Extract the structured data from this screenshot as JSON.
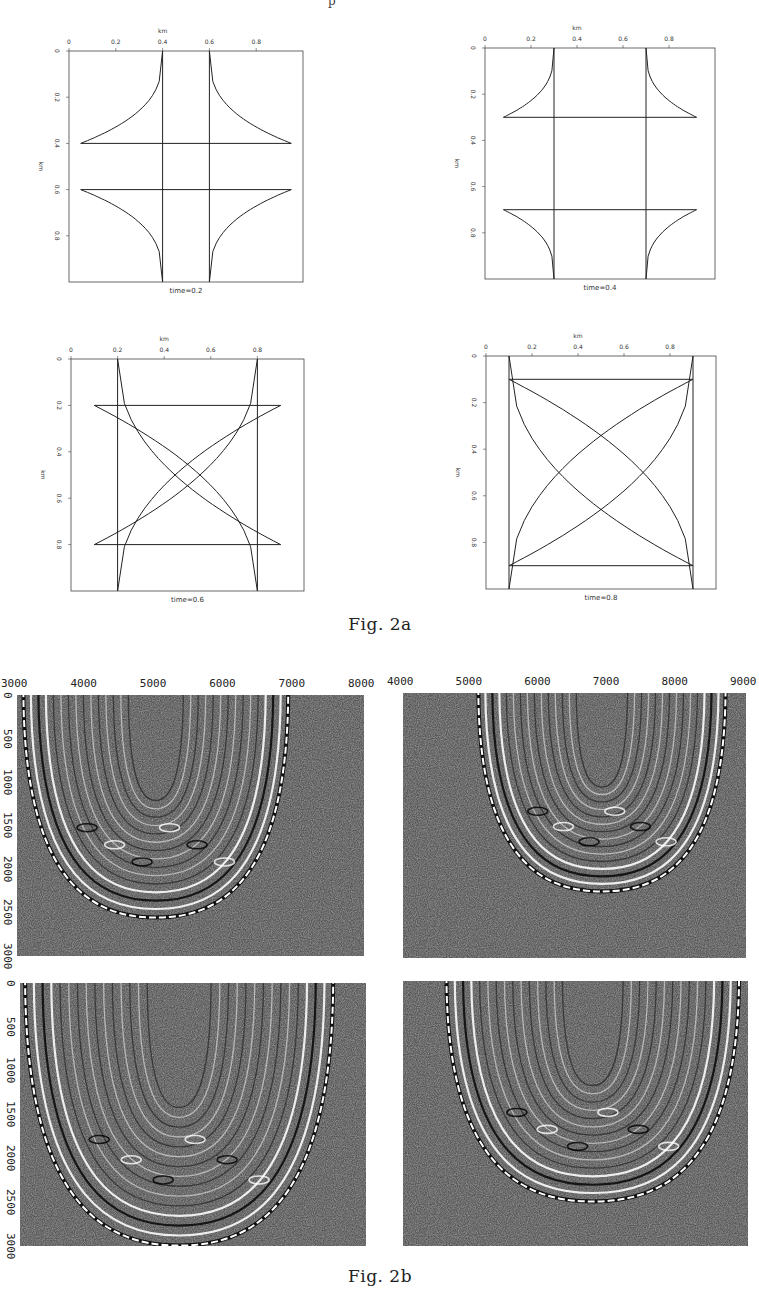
{
  "page_fragment": "p",
  "figure_2a": {
    "caption": "Fig. 2a",
    "x_axis_title": "km",
    "y_axis_title": "km",
    "x_ticks": [
      "0",
      "0.2",
      "0.4",
      "0.6",
      "0.8"
    ],
    "y_ticks": [
      "0",
      "0.2",
      "0.4",
      "0.6",
      "0.8"
    ],
    "panels": [
      {
        "label": "time=0.2",
        "time": 0.2
      },
      {
        "label": "time=0.4",
        "time": 0.4
      },
      {
        "label": "time=0.6",
        "time": 0.6
      },
      {
        "label": "time=0.8",
        "time": 0.8
      }
    ]
  },
  "figure_2b": {
    "caption": "Fig. 2b",
    "panels": [
      {
        "x_ticks": [
          "3000",
          "4000",
          "5000",
          "6000",
          "7000",
          "8000"
        ],
        "y_ticks": [
          "0",
          "500",
          "1000",
          "1500",
          "2000",
          "2500",
          "3000"
        ]
      },
      {
        "x_ticks": [
          "4000",
          "5000",
          "6000",
          "7000",
          "8000",
          "9000"
        ],
        "y_ticks": []
      },
      {
        "x_ticks": [],
        "y_ticks": [
          "0",
          "500",
          "1000",
          "1500",
          "2000",
          "2500",
          "3000"
        ]
      },
      {
        "x_ticks": [],
        "y_ticks": []
      }
    ]
  },
  "chart_data": [
    {
      "type": "line",
      "title": "time=0.2",
      "xlabel": "km",
      "ylabel": "km",
      "xlim": [
        0,
        1
      ],
      "ylim": [
        1,
        0
      ],
      "x_ticks": [
        0,
        0.2,
        0.4,
        0.6,
        0.8
      ],
      "y_ticks": [
        0,
        0.2,
        0.4,
        0.6,
        0.8
      ],
      "description": "Wavefronts: vertical lines at x=0.2 and x=0.8, horizontal lines at y=0.2 and y=0.8 with curved cusp tails at each corner"
    },
    {
      "type": "line",
      "title": "time=0.4",
      "xlabel": "km",
      "ylabel": "km",
      "xlim": [
        0,
        1
      ],
      "ylim": [
        1,
        0
      ],
      "x_ticks": [
        0,
        0.2,
        0.4,
        0.6,
        0.8
      ],
      "y_ticks": [
        0,
        0.2,
        0.4,
        0.6,
        0.8
      ],
      "description": "Wavefronts: vertical lines at x=0.4 and x=0.6, horizontal lines at y=0.4 and y=0.6 with concave arcs"
    },
    {
      "type": "line",
      "title": "time=0.6",
      "xlabel": "km",
      "ylabel": "km",
      "xlim": [
        0,
        1
      ],
      "ylim": [
        1,
        0
      ],
      "x_ticks": [
        0,
        0.2,
        0.4,
        0.6,
        0.8
      ],
      "y_ticks": [
        0,
        0.2,
        0.4,
        0.6,
        0.8
      ],
      "description": "Wavefronts: vertical lines at x=0.4 and x=0.6, horizontal lines at y=0.4 and y=0.6, crossing arcs forming a star"
    },
    {
      "type": "line",
      "title": "time=0.8",
      "xlabel": "km",
      "ylabel": "km",
      "xlim": [
        0,
        1
      ],
      "ylim": [
        1,
        0
      ],
      "x_ticks": [
        0,
        0.2,
        0.4,
        0.6,
        0.8
      ],
      "y_ticks": [
        0,
        0.2,
        0.4,
        0.6,
        0.8
      ],
      "description": "Wavefronts: vertical lines at x=0.2 and x=0.8, horizontal lines at y=0.2 and y=0.8, large crossing arcs"
    },
    {
      "type": "heatmap",
      "title": "Fig. 2b panel 1 (seismic image)",
      "xlim": [
        3000,
        8000
      ],
      "ylim": [
        3000,
        0
      ],
      "x_ticks": [
        3000,
        4000,
        5000,
        6000,
        7000,
        8000
      ],
      "y_ticks": [
        0,
        500,
        1000,
        1500,
        2000,
        2500,
        3000
      ]
    },
    {
      "type": "heatmap",
      "title": "Fig. 2b panel 2 (seismic image)",
      "xlim": [
        4000,
        9000
      ],
      "ylim": [
        3000,
        0
      ],
      "x_ticks": [
        4000,
        5000,
        6000,
        7000,
        8000,
        9000
      ]
    },
    {
      "type": "heatmap",
      "title": "Fig. 2b panel 3 (seismic image)",
      "xlim": [
        3000,
        8000
      ],
      "ylim": [
        3000,
        0
      ],
      "y_ticks": [
        0,
        500,
        1000,
        1500,
        2000,
        2500,
        3000
      ]
    },
    {
      "type": "heatmap",
      "title": "Fig. 2b panel 4 (seismic image)",
      "xlim": [
        4000,
        9000
      ],
      "ylim": [
        3000,
        0
      ]
    }
  ]
}
